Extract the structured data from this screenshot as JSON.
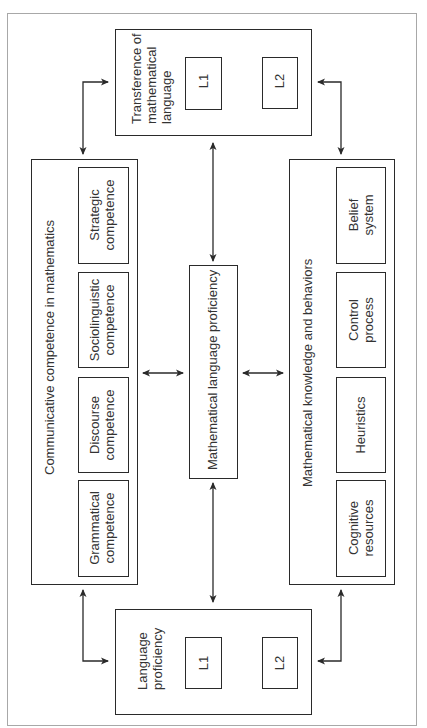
{
  "diagram": {
    "title": "",
    "orientation": "rotated -90deg",
    "nodes": {
      "transference": {
        "label_line1": "Transference of",
        "label_line2": "mathematical",
        "label_line3": "language",
        "l1": "L1",
        "l2": "L2"
      },
      "language_proficiency": {
        "label_line1": "Language",
        "label_line2": "proficiency",
        "l1": "L1",
        "l2": "L2"
      },
      "communicative": {
        "label": "Communicative competence in mathematics",
        "items": [
          {
            "line1": "Strategic",
            "line2": "competence"
          },
          {
            "line1": "Sociolinguistic",
            "line2": "competence"
          },
          {
            "line1": "Discourse",
            "line2": "competence"
          },
          {
            "line1": "Grammatical",
            "line2": "competence"
          }
        ]
      },
      "math_knowledge": {
        "label": "Mathematical knowledge and behaviors",
        "items": [
          {
            "line1": "Belief",
            "line2": "system"
          },
          {
            "line1": "Control",
            "line2": "process"
          },
          {
            "line1": "Heuristics",
            "line2": ""
          },
          {
            "line1": "Cognitive",
            "line2": "resources"
          }
        ]
      },
      "center": {
        "label": "Mathematical language proficiency"
      }
    },
    "edges": [
      {
        "from": "transference",
        "to": "communicative",
        "type": "bidirectional"
      },
      {
        "from": "transference",
        "to": "math_knowledge",
        "type": "bidirectional"
      },
      {
        "from": "transference",
        "to": "center",
        "type": "bidirectional"
      },
      {
        "from": "language_proficiency",
        "to": "communicative",
        "type": "bidirectional"
      },
      {
        "from": "language_proficiency",
        "to": "math_knowledge",
        "type": "bidirectional"
      },
      {
        "from": "language_proficiency",
        "to": "center",
        "type": "bidirectional"
      },
      {
        "from": "communicative",
        "to": "center",
        "type": "bidirectional"
      },
      {
        "from": "center",
        "to": "math_knowledge",
        "type": "bidirectional"
      },
      {
        "from": "L1",
        "to": "L2",
        "type": "bidirectional"
      }
    ],
    "colors": {
      "line": "#2a2a2a",
      "frame": "#a8a8a8",
      "text": "#333333"
    }
  }
}
